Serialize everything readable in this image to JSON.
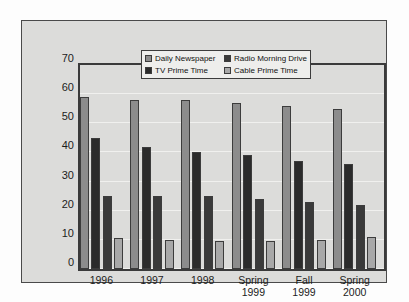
{
  "chart_data": {
    "type": "bar",
    "title": "",
    "subtitle": "",
    "xlabel": "",
    "ylabel": "",
    "ylim": [
      0,
      70
    ],
    "yticks": [
      0,
      10,
      20,
      30,
      40,
      50,
      60,
      70
    ],
    "grid": true,
    "legend_position": "top-center",
    "categories": [
      "1996",
      "1997",
      "1998",
      "Spring\n1999",
      "Fall\n1999",
      "Spring\n2000"
    ],
    "series": [
      {
        "name": "Daily Newspaper",
        "color": "#8c8c8c",
        "values": [
          59,
          58,
          58,
          57,
          56,
          55
        ]
      },
      {
        "name": "TV Prime Time",
        "color": "#2b2b2b",
        "values": [
          45,
          42,
          40,
          39,
          37,
          36
        ]
      },
      {
        "name": "Radio Morning Drive",
        "color": "#3a3a3a",
        "values": [
          25,
          25,
          25,
          24,
          23,
          22
        ]
      },
      {
        "name": "Cable Prime Time",
        "color": "#a8a8a8",
        "values": [
          10.5,
          10,
          9.5,
          9.5,
          10,
          11
        ]
      }
    ]
  },
  "colors": {
    "page_background": "#fdfdfd",
    "panel_background": "#dcdcda",
    "panel_border": "#4a4a4a",
    "axis": "#3a3a3a",
    "gridline": "#f0f0ee",
    "legend_background": "#eeeeec",
    "text": "#1c1c1c"
  }
}
